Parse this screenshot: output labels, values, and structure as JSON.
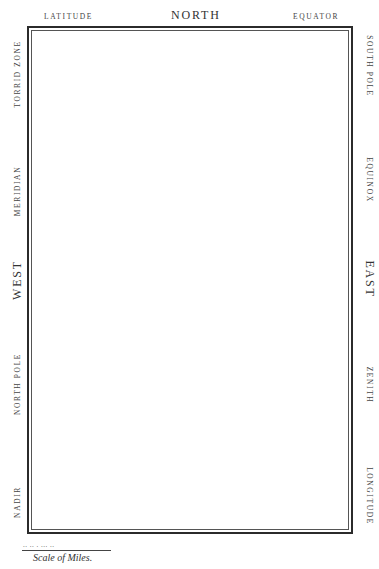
{
  "top": {
    "left_label": "LATITUDE",
    "center_label": "NORTH",
    "right_label": "EQUATOR"
  },
  "left_side": {
    "labels": [
      "TORRID ZONE",
      "MERIDIAN",
      "WEST",
      "NORTH POLE",
      "NADIR"
    ]
  },
  "right_side": {
    "labels": [
      "SOUTH POLE",
      "EQUINOX",
      "EAST",
      "ZENITH",
      "LONGITUDE"
    ]
  },
  "scale": {
    "marks": ".. ..  .  ...  ..",
    "caption": "Scale of Miles."
  }
}
